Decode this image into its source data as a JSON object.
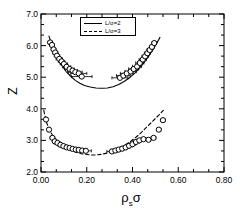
{
  "chart_data": {
    "type": "scatter",
    "title": "",
    "xlabel": "ρₛσ",
    "ylabel": "Z",
    "xlim": [
      0.0,
      0.8
    ],
    "ylim": [
      2.0,
      7.0
    ],
    "xticks": [
      "0.00",
      "0.20",
      "0.40",
      "0.60",
      "0.80"
    ],
    "xtick_values": [
      0.0,
      0.2,
      0.4,
      0.6,
      0.8
    ],
    "yticks": [
      "2.0",
      "3.0",
      "4.0",
      "5.0",
      "6.0",
      "7.0"
    ],
    "ytick_values": [
      2.0,
      3.0,
      4.0,
      5.0,
      6.0,
      7.0
    ],
    "minor_ticks_per_interval": 2,
    "grid": false,
    "legend_position": "top-center",
    "marker": "open-circle",
    "error_bars": "horizontal",
    "legend": [
      {
        "label": "L/σ=2",
        "style": "solid"
      },
      {
        "label": "L/σ=3",
        "style": "dashed"
      }
    ],
    "series": [
      {
        "name": "L/σ=2",
        "style": "solid",
        "curve": [
          {
            "x": 0.035,
            "y": 6.3
          },
          {
            "x": 0.05,
            "y": 5.95
          },
          {
            "x": 0.07,
            "y": 5.63
          },
          {
            "x": 0.09,
            "y": 5.38
          },
          {
            "x": 0.11,
            "y": 5.18
          },
          {
            "x": 0.13,
            "y": 5.03
          },
          {
            "x": 0.15,
            "y": 4.9
          },
          {
            "x": 0.17,
            "y": 4.81
          },
          {
            "x": 0.19,
            "y": 4.74
          },
          {
            "x": 0.215,
            "y": 4.69
          },
          {
            "x": 0.24,
            "y": 4.66
          },
          {
            "x": 0.265,
            "y": 4.65
          },
          {
            "x": 0.29,
            "y": 4.66
          },
          {
            "x": 0.315,
            "y": 4.7
          },
          {
            "x": 0.34,
            "y": 4.77
          },
          {
            "x": 0.365,
            "y": 4.87
          },
          {
            "x": 0.39,
            "y": 5.0
          },
          {
            "x": 0.41,
            "y": 5.13
          },
          {
            "x": 0.43,
            "y": 5.28
          },
          {
            "x": 0.45,
            "y": 5.46
          },
          {
            "x": 0.47,
            "y": 5.66
          },
          {
            "x": 0.49,
            "y": 5.88
          },
          {
            "x": 0.505,
            "y": 6.06
          },
          {
            "x": 0.52,
            "y": 6.26
          }
        ],
        "points": [
          {
            "x": 0.04,
            "y": 6.1,
            "xerr": 0.01
          },
          {
            "x": 0.048,
            "y": 6.02,
            "xerr": 0.01
          },
          {
            "x": 0.055,
            "y": 5.88,
            "xerr": 0.01
          },
          {
            "x": 0.062,
            "y": 5.78,
            "xerr": 0.012
          },
          {
            "x": 0.07,
            "y": 5.68,
            "xerr": 0.012
          },
          {
            "x": 0.08,
            "y": 5.58,
            "xerr": 0.014
          },
          {
            "x": 0.09,
            "y": 5.5,
            "xerr": 0.014
          },
          {
            "x": 0.1,
            "y": 5.42,
            "xerr": 0.016
          },
          {
            "x": 0.112,
            "y": 5.33,
            "xerr": 0.018
          },
          {
            "x": 0.125,
            "y": 5.26,
            "xerr": 0.02
          },
          {
            "x": 0.138,
            "y": 5.21,
            "xerr": 0.022
          },
          {
            "x": 0.15,
            "y": 5.16,
            "xerr": 0.03
          },
          {
            "x": 0.165,
            "y": 5.12,
            "xerr": 0.035
          },
          {
            "x": 0.178,
            "y": 5.02,
            "xerr": 0.045
          },
          {
            "x": 0.345,
            "y": 4.98,
            "xerr": 0.035
          },
          {
            "x": 0.36,
            "y": 5.05,
            "xerr": 0.03
          },
          {
            "x": 0.375,
            "y": 5.12,
            "xerr": 0.028
          },
          {
            "x": 0.392,
            "y": 5.18,
            "xerr": 0.025
          },
          {
            "x": 0.405,
            "y": 5.26,
            "xerr": 0.022
          },
          {
            "x": 0.42,
            "y": 5.34,
            "xerr": 0.02
          },
          {
            "x": 0.432,
            "y": 5.45,
            "xerr": 0.018
          },
          {
            "x": 0.445,
            "y": 5.56,
            "xerr": 0.016
          },
          {
            "x": 0.455,
            "y": 5.66,
            "xerr": 0.014
          },
          {
            "x": 0.465,
            "y": 5.76,
            "xerr": 0.013
          },
          {
            "x": 0.475,
            "y": 5.86,
            "xerr": 0.012
          },
          {
            "x": 0.485,
            "y": 5.96,
            "xerr": 0.011
          },
          {
            "x": 0.495,
            "y": 6.08,
            "xerr": 0.01
          }
        ]
      },
      {
        "name": "L/σ=3",
        "style": "dashed",
        "curve": [
          {
            "x": 0.012,
            "y": 3.95
          },
          {
            "x": 0.025,
            "y": 3.55
          },
          {
            "x": 0.04,
            "y": 3.28
          },
          {
            "x": 0.058,
            "y": 3.08
          },
          {
            "x": 0.075,
            "y": 2.95
          },
          {
            "x": 0.095,
            "y": 2.83
          },
          {
            "x": 0.115,
            "y": 2.74
          },
          {
            "x": 0.135,
            "y": 2.68
          },
          {
            "x": 0.155,
            "y": 2.62
          },
          {
            "x": 0.175,
            "y": 2.58
          },
          {
            "x": 0.195,
            "y": 2.56
          },
          {
            "x": 0.215,
            "y": 2.54
          },
          {
            "x": 0.24,
            "y": 2.54
          },
          {
            "x": 0.265,
            "y": 2.56
          },
          {
            "x": 0.29,
            "y": 2.6
          },
          {
            "x": 0.315,
            "y": 2.66
          },
          {
            "x": 0.34,
            "y": 2.74
          },
          {
            "x": 0.365,
            "y": 2.84
          },
          {
            "x": 0.39,
            "y": 2.96
          },
          {
            "x": 0.415,
            "y": 3.1
          },
          {
            "x": 0.44,
            "y": 3.26
          },
          {
            "x": 0.465,
            "y": 3.44
          },
          {
            "x": 0.49,
            "y": 3.62
          },
          {
            "x": 0.515,
            "y": 3.8
          },
          {
            "x": 0.535,
            "y": 3.95
          }
        ],
        "points": [
          {
            "x": 0.022,
            "y": 3.66,
            "xerr": 0.006
          },
          {
            "x": 0.035,
            "y": 3.34,
            "xerr": 0.008
          },
          {
            "x": 0.05,
            "y": 3.08,
            "xerr": 0.01
          },
          {
            "x": 0.06,
            "y": 2.97,
            "xerr": 0.01
          },
          {
            "x": 0.072,
            "y": 2.92,
            "xerr": 0.012
          },
          {
            "x": 0.085,
            "y": 2.86,
            "xerr": 0.012
          },
          {
            "x": 0.098,
            "y": 2.82,
            "xerr": 0.014
          },
          {
            "x": 0.112,
            "y": 2.78,
            "xerr": 0.014
          },
          {
            "x": 0.125,
            "y": 2.76,
            "xerr": 0.016
          },
          {
            "x": 0.138,
            "y": 2.73,
            "xerr": 0.016
          },
          {
            "x": 0.152,
            "y": 2.71,
            "xerr": 0.018
          },
          {
            "x": 0.165,
            "y": 2.7,
            "xerr": 0.02
          },
          {
            "x": 0.18,
            "y": 2.68,
            "xerr": 0.022
          },
          {
            "x": 0.196,
            "y": 2.67,
            "xerr": 0.024
          },
          {
            "x": 0.31,
            "y": 2.65,
            "xerr": 0.022
          },
          {
            "x": 0.325,
            "y": 2.68,
            "xerr": 0.02
          },
          {
            "x": 0.34,
            "y": 2.71,
            "xerr": 0.018
          },
          {
            "x": 0.355,
            "y": 2.74,
            "xerr": 0.018
          },
          {
            "x": 0.37,
            "y": 2.78,
            "xerr": 0.016
          },
          {
            "x": 0.385,
            "y": 2.83,
            "xerr": 0.016
          },
          {
            "x": 0.4,
            "y": 2.88,
            "xerr": 0.014
          },
          {
            "x": 0.415,
            "y": 2.95,
            "xerr": 0.014
          },
          {
            "x": 0.43,
            "y": 3.0,
            "xerr": 0.012
          },
          {
            "x": 0.448,
            "y": 3.04,
            "xerr": 0.012
          },
          {
            "x": 0.47,
            "y": 3.02,
            "xerr": 0.01
          },
          {
            "x": 0.492,
            "y": 3.08,
            "xerr": 0.01
          },
          {
            "x": 0.515,
            "y": 3.34,
            "xerr": 0.01
          },
          {
            "x": 0.533,
            "y": 3.64,
            "xerr": 0.01
          }
        ]
      }
    ]
  },
  "axes": {
    "x_label_html": "ρ",
    "x_label_sub": "s",
    "x_label_tail": "σ",
    "y_label": "Z"
  },
  "colors": {
    "axis": "#000000",
    "marker_stroke": "#000000",
    "background": "#ffffff"
  }
}
